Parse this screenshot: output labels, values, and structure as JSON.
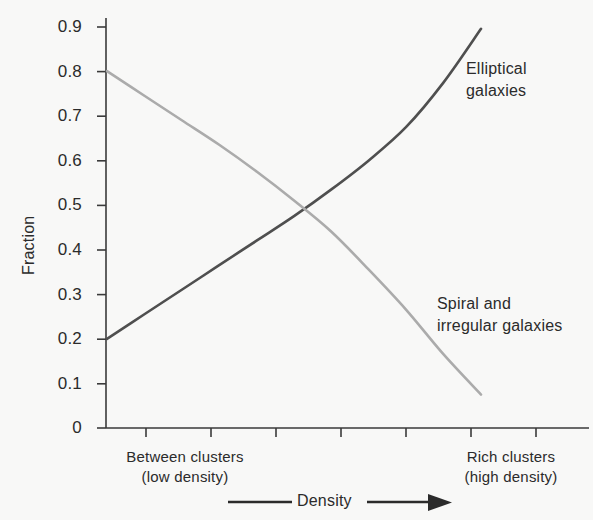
{
  "chart_data": {
    "type": "line",
    "title": "",
    "xlabel": "Density",
    "ylabel": "Fraction",
    "ylim": [
      0,
      0.9
    ],
    "ytick_labels": [
      "0.9",
      "0.8",
      "0.7",
      "0.6",
      "0.5",
      "0.4",
      "0.3",
      "0.2",
      "0.1",
      "0"
    ],
    "ytick_values": [
      0.9,
      0.8,
      0.7,
      0.6,
      0.5,
      0.4,
      0.3,
      0.2,
      0.1,
      0
    ],
    "xlim": [
      0,
      1
    ],
    "xtick_count": 8,
    "grid": false,
    "legend_position": "inline-annotations",
    "x_category_left": "Between clusters\n(low density)",
    "x_category_right": "Rich clusters\n(high density)",
    "crossing_point": {
      "x": 0.53,
      "y": 0.49
    },
    "series": [
      {
        "name": "Elliptical galaxies",
        "color": "#4f4f4f",
        "x": [
          0.0,
          0.1,
          0.2,
          0.3,
          0.4,
          0.5,
          0.6,
          0.7,
          0.8,
          0.9,
          1.0
        ],
        "values": [
          0.2,
          0.255,
          0.31,
          0.365,
          0.42,
          0.475,
          0.535,
          0.6,
          0.675,
          0.775,
          0.895
        ]
      },
      {
        "name": "Spiral and irregular galaxies",
        "color": "#ababab",
        "x": [
          0.0,
          0.1,
          0.2,
          0.3,
          0.4,
          0.5,
          0.6,
          0.7,
          0.8,
          0.9,
          1.0
        ],
        "values": [
          0.8,
          0.745,
          0.69,
          0.635,
          0.575,
          0.51,
          0.44,
          0.355,
          0.265,
          0.165,
          0.075
        ]
      }
    ]
  },
  "axes": {
    "y_title": "Fraction",
    "tick_labels": {
      "t09": "0.9",
      "t08": "0.8",
      "t07": "0.7",
      "t06": "0.6",
      "t05": "0.5",
      "t04": "0.4",
      "t03": "0.3",
      "t02": "0.2",
      "t01": "0.1",
      "t00": "0"
    },
    "x_left_line1": "Between clusters",
    "x_left_line2": "(low density)",
    "x_right_line1": "Rich clusters",
    "x_right_line2": "(high density)",
    "x_axis_title": "Density"
  },
  "annotations": {
    "elliptical_line1": "Elliptical",
    "elliptical_line2": "galaxies",
    "spiral_line1": "Spiral and",
    "spiral_line2": "irregular galaxies"
  },
  "colors": {
    "background": "#f8f8f7",
    "axis": "#3a3a3a",
    "text": "#2b2b2b",
    "series_elliptical": "#4f4f4f",
    "series_spiral": "#ababab"
  }
}
